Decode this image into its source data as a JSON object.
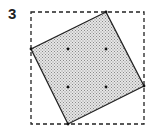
{
  "figure": {
    "label": "3",
    "colors": {
      "stroke": "#222222",
      "fill_dot": "#9a9a9a",
      "background": "#ffffff"
    },
    "bounding_box": {
      "x": 31,
      "y": 12,
      "width": 113,
      "height": 112,
      "style": "dashed"
    },
    "rotated_square": {
      "points": [
        [
          106,
          12
        ],
        [
          144,
          86
        ],
        [
          68,
          124
        ],
        [
          31,
          49
        ]
      ],
      "fill": "stippled-gray"
    },
    "dots": [
      [
        68,
        49
      ],
      [
        106,
        49
      ],
      [
        68,
        87
      ],
      [
        106,
        87
      ]
    ]
  }
}
